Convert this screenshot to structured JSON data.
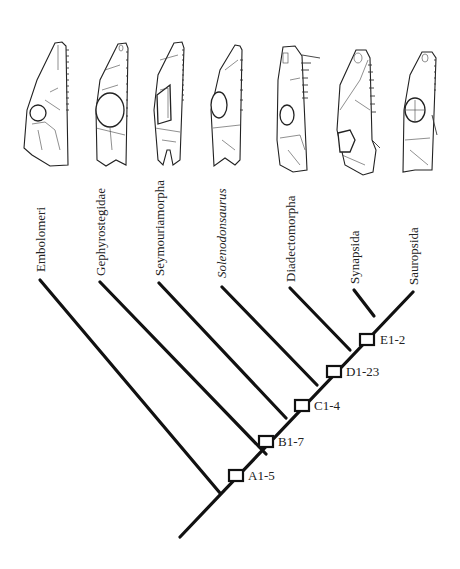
{
  "figure": {
    "type": "cladogram",
    "colors": {
      "line": "#111111",
      "text": "#222222",
      "background": "#ffffff"
    },
    "taxa": [
      {
        "name": "Embolomeri",
        "italic": false,
        "tip": [
          40,
          280
        ],
        "label_x": 46,
        "label_y": 262
      },
      {
        "name": "Gephyrostegidae",
        "italic": false,
        "tip": [
          100,
          282
        ],
        "label_x": 106,
        "label_y": 262
      },
      {
        "name": "Seymouriamorpha",
        "italic": false,
        "tip": [
          159,
          283
        ],
        "label_x": 165,
        "label_y": 262
      },
      {
        "name": "Solenodonsaurus",
        "italic": true,
        "tip": [
          222,
          287
        ],
        "label_x": 227,
        "label_y": 262
      },
      {
        "name": "Diadectomorpha",
        "italic": false,
        "tip": [
          290,
          288
        ],
        "label_x": 296,
        "label_y": 278
      },
      {
        "name": "Synapsida",
        "italic": false,
        "tip": [
          354,
          290
        ],
        "label_x": 360,
        "label_y": 285
      },
      {
        "name": "Sauropsida",
        "italic": false,
        "tip": [
          413,
          292
        ],
        "label_x": 419,
        "label_y": 285
      }
    ],
    "root": [
      180,
      537
    ],
    "nodes": [
      {
        "id": "n1",
        "pos": [
          220,
          493
        ]
      },
      {
        "id": "n2",
        "pos": [
          250,
          458
        ]
      },
      {
        "id": "n3",
        "pos": [
          285,
          418
        ]
      },
      {
        "id": "n4",
        "pos": [
          318,
          375
        ]
      },
      {
        "id": "n5",
        "pos": [
          348,
          345
        ]
      },
      {
        "id": "n6",
        "pos": [
          377,
          312
        ]
      }
    ],
    "synapomorphies": [
      {
        "label": "A1-5",
        "box": [
          236,
          476
        ]
      },
      {
        "label": "B1-7",
        "box": [
          266,
          441
        ]
      },
      {
        "label": "C1-4",
        "box": [
          302,
          405
        ]
      },
      {
        "label": "D1-23",
        "box": [
          334,
          371
        ]
      },
      {
        "label": "E1-2",
        "box": [
          366,
          338
        ]
      }
    ],
    "skulls": [
      "embolomere-skull",
      "gephyrostegid-skull",
      "seymouriamorph-skull",
      "solenodonsaurus-skull",
      "diadectomorph-skull",
      "synapsid-skull",
      "sauropsid-skull"
    ]
  }
}
